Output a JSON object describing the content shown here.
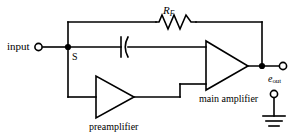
{
  "figure": {
    "kind": "circuit-schematic",
    "background_color": "#ffffff",
    "line_color": "#000000"
  },
  "labels": {
    "input": "input",
    "node_s": "S",
    "feedback_resistor": "R",
    "feedback_resistor_sub": "F",
    "output_symbol": "e",
    "output_symbol_sub": "out",
    "main_amplifier": "main amplifier",
    "preamplifier": "preamplifier"
  },
  "components": [
    {
      "name": "input-terminal",
      "type": "terminal",
      "label": "input"
    },
    {
      "name": "summing-node-s",
      "type": "junction",
      "label": "S"
    },
    {
      "name": "feedback-resistor",
      "type": "resistor",
      "label": "RF"
    },
    {
      "name": "coupling-capacitor",
      "type": "capacitor",
      "label": ""
    },
    {
      "name": "preamplifier",
      "type": "triangle-amplifier",
      "label": "preamplifier"
    },
    {
      "name": "main-amplifier",
      "type": "triangle-amplifier",
      "label": "main amplifier"
    },
    {
      "name": "output-terminal",
      "type": "terminal",
      "label": "eout"
    },
    {
      "name": "ground-terminal",
      "type": "ground",
      "label": ""
    }
  ]
}
